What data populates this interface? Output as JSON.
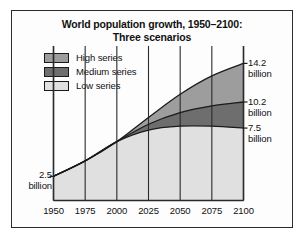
{
  "figure": {
    "title_lines": [
      "World population growth, 1950–2100:",
      "Three scenarios"
    ],
    "frame_color": "#2b2b2b",
    "background": "#ffffff"
  },
  "legend": {
    "items": [
      {
        "label": "High series",
        "color": "#9d9d9d",
        "key": "high"
      },
      {
        "label": "Medium series",
        "color": "#6e6e6e",
        "key": "medium"
      },
      {
        "label": "Low series",
        "color": "#e0e0e0",
        "key": "low"
      }
    ]
  },
  "annotations": {
    "start": {
      "number": "2.5",
      "unit": "billion"
    },
    "high": {
      "number": "14.2",
      "unit": "billion"
    },
    "medium": {
      "number": "10.2",
      "unit": "billion"
    },
    "low": {
      "number": "7.5",
      "unit": "billion"
    }
  },
  "chart_data": {
    "type": "area",
    "title": "World population growth, 1950–2100: Three scenarios",
    "subtitle": "Three scenarios",
    "xlabel": "",
    "ylabel": "",
    "grid": true,
    "legend_position": "top-left",
    "xlim": [
      1950,
      2100
    ],
    "ylim": [
      0,
      16
    ],
    "x": [
      1950,
      1975,
      2000,
      2025,
      2050,
      2075,
      2100
    ],
    "tick_labels": [
      "1950",
      "1975",
      "2000",
      "2025",
      "2050",
      "2075",
      "2100"
    ],
    "unit": "billion",
    "series": [
      {
        "name": "Low series",
        "color": "#e0e0e0",
        "values": [
          2.5,
          4.1,
          6.1,
          7.3,
          7.7,
          7.7,
          7.5
        ],
        "end_label": "7.5 billion"
      },
      {
        "name": "Medium series",
        "color": "#6e6e6e",
        "values": [
          2.5,
          4.1,
          6.1,
          7.9,
          9.1,
          9.8,
          10.2
        ],
        "end_label": "10.2 billion"
      },
      {
        "name": "High series",
        "color": "#9d9d9d",
        "values": [
          2.5,
          4.1,
          6.1,
          8.6,
          11.0,
          12.9,
          14.2
        ],
        "end_label": "14.2 billion"
      }
    ],
    "annotations": [
      {
        "text": "2.5 billion",
        "x": 1950,
        "y": 2.5
      },
      {
        "text": "7.5 billion",
        "x": 2100,
        "y": 7.5
      },
      {
        "text": "10.2 billion",
        "x": 2100,
        "y": 10.2
      },
      {
        "text": "14.2 billion",
        "x": 2100,
        "y": 14.2
      }
    ]
  }
}
